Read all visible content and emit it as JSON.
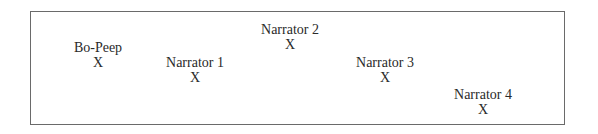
{
  "diagram": {
    "positions": [
      {
        "label": "Bo-Peep",
        "mark": "X",
        "cx": 98,
        "top": 40
      },
      {
        "label": "Narrator 1",
        "mark": "X",
        "cx": 195,
        "top": 55
      },
      {
        "label": "Narrator 2",
        "mark": "X",
        "cx": 290,
        "top": 22
      },
      {
        "label": "Narrator 3",
        "mark": "X",
        "cx": 385,
        "top": 55
      },
      {
        "label": "Narrator 4",
        "mark": "X",
        "cx": 483,
        "top": 87
      }
    ]
  }
}
